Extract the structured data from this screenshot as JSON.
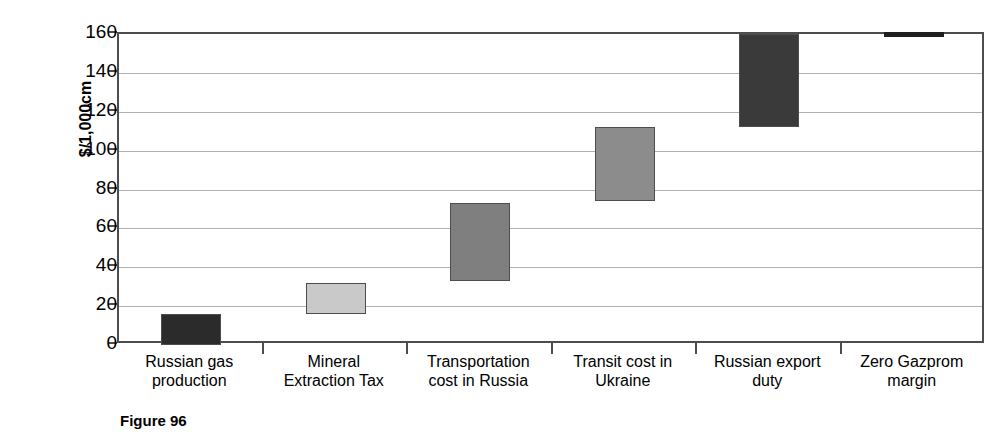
{
  "caption": "Figure 96",
  "chart_data": {
    "type": "bar",
    "chart_style": "waterfall",
    "title": "",
    "subtitle": "",
    "xlabel": "",
    "ylabel": "$/1,000cm",
    "ylim": [
      0,
      160
    ],
    "yticks": [
      0,
      20,
      40,
      60,
      80,
      100,
      120,
      140,
      160
    ],
    "ytick_labels": [
      "0",
      "20",
      "40",
      "60",
      "80",
      "100",
      "120",
      "140",
      "160"
    ],
    "grid": true,
    "legend": "none",
    "categories": [
      "Russian gas production",
      "Mineral Extraction Tax",
      "Transportation cost in Russia",
      "Transit cost in Ukraine",
      "Russian export duty",
      "Zero Gazprom margin"
    ],
    "category_lines": [
      [
        "Russian gas",
        "production"
      ],
      [
        "Mineral",
        "Extraction Tax"
      ],
      [
        "Transportation",
        "cost in Russia"
      ],
      [
        "Transit cost in",
        "Ukraine"
      ],
      [
        "Russian export",
        "duty"
      ],
      [
        "Zero Gazprom",
        "margin"
      ]
    ],
    "bars": [
      {
        "label": "Russian gas production",
        "base": 0,
        "top": 16,
        "value": 16,
        "color": "#2b2b2b"
      },
      {
        "label": "Mineral Extraction Tax",
        "base": 16,
        "top": 32,
        "value": 16,
        "color": "#c9c9c9"
      },
      {
        "label": "Transportation cost in Russia",
        "base": 33,
        "top": 73,
        "value": 40,
        "color": "#7f7f7f"
      },
      {
        "label": "Transit cost in Ukraine",
        "base": 74,
        "top": 112,
        "value": 38,
        "color": "#8c8c8c"
      },
      {
        "label": "Russian export duty",
        "base": 112,
        "top": 160,
        "value": 48,
        "color": "#3a3a3a"
      },
      {
        "label": "Zero Gazprom margin",
        "base": 160,
        "top": 160,
        "value": 0,
        "color": "#1f1f1f"
      }
    ],
    "values": [
      16,
      16,
      40,
      38,
      48,
      0
    ],
    "cumulative_top": [
      16,
      32,
      73,
      112,
      160,
      160
    ],
    "units": "$/1,000cm"
  },
  "colors": {
    "axis": "#4d4d4d",
    "gridline": "#b0b0b0",
    "background": "#ffffff",
    "text": "#000000"
  }
}
